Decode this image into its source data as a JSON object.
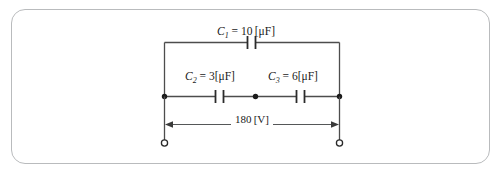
{
  "figure": {
    "type": "circuit-diagram",
    "border_color": "#b9bbbd",
    "wire_color": "#4d4d4d",
    "background": "#ffffff"
  },
  "labels": {
    "c1": {
      "symbol": "C",
      "subscript": "1",
      "equals": " = ",
      "value": "10",
      "unit": "[μF]",
      "full": "C₁ = 10 [μF]"
    },
    "c2": {
      "symbol": "C",
      "subscript": "2",
      "equals": " = ",
      "value": "3",
      "unit": "[μF]",
      "full": "C₂ = 3 [μF]"
    },
    "c3": {
      "symbol": "C",
      "subscript": "3",
      "equals": " = ",
      "value": "6",
      "unit": "[μF]",
      "full": "C₃ = 6 [μF]"
    },
    "voltage": {
      "value": "180",
      "unit": "[V]",
      "full": "180 [V]"
    }
  },
  "components": {
    "capacitor_top": "capacitor-c1",
    "capacitor_mid_left": "capacitor-c2",
    "capacitor_mid_right": "capacitor-c3",
    "node_left": "junction-node-left",
    "node_center": "junction-node-center",
    "node_right": "junction-node-right",
    "terminal_left": "terminal-left",
    "terminal_right": "terminal-right",
    "dimension": "voltage-dimension-line"
  }
}
